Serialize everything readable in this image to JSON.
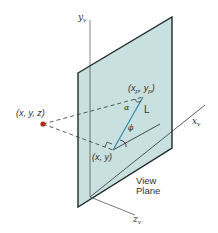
{
  "diagram": {
    "colors": {
      "plane_fill": "#c9e0e0",
      "plane_edge": "#1f2a2a",
      "axis": "#555555",
      "projection_line": "#3a8fb0",
      "dashed": "#333333",
      "point": "#b02a1a"
    },
    "axes": {
      "y": {
        "label": "y",
        "sub": "v"
      },
      "x": {
        "label": "x",
        "sub": "v"
      },
      "z": {
        "label": "z",
        "sub": "v"
      }
    },
    "points": {
      "world": {
        "label": "(x, y, z)"
      },
      "projected": {
        "label_pre": "(x",
        "sub1": "p",
        "mid": ", y",
        "sub2": "p",
        "post": ")"
      },
      "orthographic": {
        "label": "(x, y)"
      }
    },
    "labels": {
      "length": "L",
      "alpha": "α",
      "phi": "ϕ",
      "plane_line1": "View",
      "plane_line2": "Plane"
    }
  }
}
